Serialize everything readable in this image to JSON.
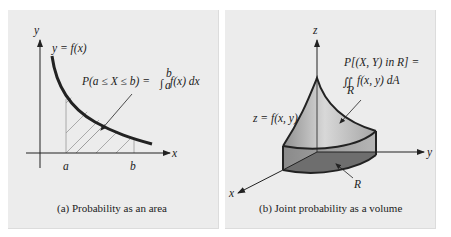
{
  "panel_a": {
    "caption": "(a) Probability as an area",
    "axis_x_label": "x",
    "axis_y_label": "y",
    "curve_label": "y = f(x)",
    "tick_a": "a",
    "tick_b": "b",
    "formula": "P(a ≤ X ≤ b) = ∫ₐᵇ f(x) dx",
    "formula_left": "P(a ≤ X ≤ b) = ",
    "formula_int_upper": "b",
    "formula_int_lower": "a",
    "formula_integrand": "f(x) dx"
  },
  "panel_b": {
    "caption": "(b) Joint probability as a volume",
    "axis_x_label": "x",
    "axis_y_label": "y",
    "axis_z_label": "z",
    "surface_label": "z = f(x, y)",
    "region_label": "R",
    "formula_line1": "P[(X, Y) in R] =",
    "formula_integrand": "f(x, y) dA",
    "formula_region_sub": "R"
  },
  "colors": {
    "background": "#ececec",
    "stroke": "#222222",
    "hatch": "#888888",
    "solid_side": "#9a9a9a",
    "solid_surface": "#c8c8c8",
    "region_dark": "#6e6e6e"
  }
}
